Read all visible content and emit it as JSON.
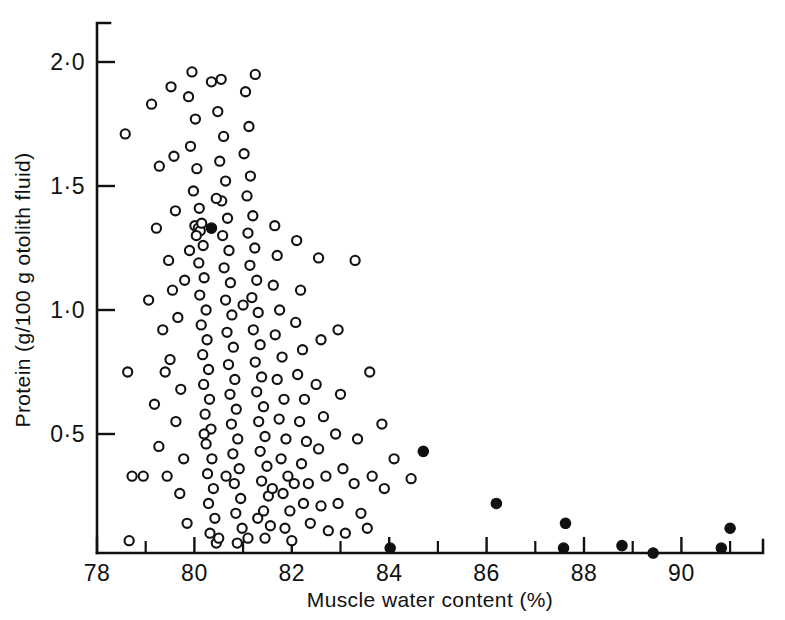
{
  "chart_data": {
    "type": "scatter",
    "title": "",
    "xlabel": "Muscle water content (%)",
    "ylabel": "Protein (g/100 g otolith fluid)",
    "xlim": [
      77.6,
      91.65
    ],
    "ylim": [
      0.0,
      2.18
    ],
    "grid": false,
    "legend": "none",
    "x_ticks_major": [
      78,
      80,
      82,
      84,
      86,
      88,
      90
    ],
    "x_ticklabels": [
      "78",
      "80",
      "82",
      "84",
      "86",
      "88",
      "90"
    ],
    "x_ticks_minor": [
      79,
      81,
      83,
      85,
      87,
      89,
      91
    ],
    "y_ticks_major": [
      0.5,
      1.0,
      1.5,
      2.0
    ],
    "y_ticklabels": [
      "0·5",
      "1·0",
      "1·5",
      "2·0"
    ],
    "marker_colors": {
      "open": "#ffffff",
      "edge": "#121212",
      "filled": "#101010"
    },
    "series": [
      {
        "name": "open circles",
        "marker": "open-circle",
        "points": [
          [
            78.58,
            1.71
          ],
          [
            78.63,
            0.75
          ],
          [
            78.72,
            0.33
          ],
          [
            78.66,
            0.07
          ],
          [
            79.12,
            1.83
          ],
          [
            79.28,
            1.58
          ],
          [
            79.22,
            1.33
          ],
          [
            79.06,
            1.04
          ],
          [
            79.35,
            0.92
          ],
          [
            79.18,
            0.62
          ],
          [
            79.27,
            0.45
          ],
          [
            79.44,
            0.33
          ],
          [
            79.52,
            1.9
          ],
          [
            79.58,
            1.62
          ],
          [
            79.61,
            1.4
          ],
          [
            79.47,
            1.2
          ],
          [
            79.55,
            1.08
          ],
          [
            79.66,
            0.97
          ],
          [
            79.5,
            0.8
          ],
          [
            79.72,
            0.68
          ],
          [
            79.62,
            0.55
          ],
          [
            79.78,
            0.4
          ],
          [
            79.7,
            0.26
          ],
          [
            79.85,
            0.14
          ],
          [
            79.95,
            1.96
          ],
          [
            79.88,
            1.86
          ],
          [
            80.02,
            1.77
          ],
          [
            79.92,
            1.66
          ],
          [
            80.05,
            1.57
          ],
          [
            79.98,
            1.48
          ],
          [
            80.1,
            1.41
          ],
          [
            80.01,
            1.34
          ],
          [
            80.08,
            1.33
          ],
          [
            80.12,
            1.32
          ],
          [
            80.15,
            1.35
          ],
          [
            80.04,
            1.3
          ],
          [
            80.18,
            1.26
          ],
          [
            80.09,
            1.19
          ],
          [
            80.2,
            1.13
          ],
          [
            80.11,
            1.06
          ],
          [
            80.24,
            1.0
          ],
          [
            80.14,
            0.94
          ],
          [
            80.26,
            0.88
          ],
          [
            80.17,
            0.82
          ],
          [
            80.29,
            0.76
          ],
          [
            80.19,
            0.7
          ],
          [
            80.31,
            0.64
          ],
          [
            80.22,
            0.58
          ],
          [
            80.34,
            0.52
          ],
          [
            80.24,
            0.46
          ],
          [
            80.36,
            0.4
          ],
          [
            80.27,
            0.34
          ],
          [
            80.39,
            0.28
          ],
          [
            80.29,
            0.22
          ],
          [
            80.42,
            0.16
          ],
          [
            80.32,
            0.1
          ],
          [
            80.45,
            0.06
          ],
          [
            80.55,
            1.93
          ],
          [
            80.48,
            1.8
          ],
          [
            80.6,
            1.7
          ],
          [
            80.52,
            1.6
          ],
          [
            80.64,
            1.52
          ],
          [
            80.56,
            1.44
          ],
          [
            80.68,
            1.37
          ],
          [
            80.58,
            1.3
          ],
          [
            80.71,
            1.24
          ],
          [
            80.61,
            1.17
          ],
          [
            80.74,
            1.11
          ],
          [
            80.64,
            1.04
          ],
          [
            80.77,
            0.98
          ],
          [
            80.67,
            0.91
          ],
          [
            80.8,
            0.85
          ],
          [
            80.7,
            0.78
          ],
          [
            80.83,
            0.72
          ],
          [
            80.73,
            0.66
          ],
          [
            80.86,
            0.6
          ],
          [
            80.76,
            0.54
          ],
          [
            80.89,
            0.48
          ],
          [
            80.79,
            0.42
          ],
          [
            80.92,
            0.36
          ],
          [
            80.82,
            0.3
          ],
          [
            80.95,
            0.24
          ],
          [
            80.85,
            0.18
          ],
          [
            80.98,
            0.12
          ],
          [
            80.88,
            0.06
          ],
          [
            81.05,
            1.88
          ],
          [
            81.12,
            1.74
          ],
          [
            81.02,
            1.63
          ],
          [
            81.15,
            1.54
          ],
          [
            81.08,
            1.46
          ],
          [
            81.2,
            1.38
          ],
          [
            81.1,
            1.31
          ],
          [
            81.24,
            1.25
          ],
          [
            81.14,
            1.18
          ],
          [
            81.28,
            1.12
          ],
          [
            81.18,
            1.05
          ],
          [
            81.31,
            0.99
          ],
          [
            81.21,
            0.92
          ],
          [
            81.35,
            0.86
          ],
          [
            81.25,
            0.79
          ],
          [
            81.38,
            0.73
          ],
          [
            81.28,
            0.67
          ],
          [
            81.42,
            0.61
          ],
          [
            81.32,
            0.55
          ],
          [
            81.45,
            0.49
          ],
          [
            81.35,
            0.43
          ],
          [
            81.49,
            0.37
          ],
          [
            81.38,
            0.31
          ],
          [
            81.52,
            0.25
          ],
          [
            81.42,
            0.19
          ],
          [
            81.56,
            0.13
          ],
          [
            81.45,
            0.08
          ],
          [
            81.65,
            1.34
          ],
          [
            81.7,
            1.22
          ],
          [
            81.62,
            1.1
          ],
          [
            81.75,
            1.0
          ],
          [
            81.66,
            0.9
          ],
          [
            81.8,
            0.81
          ],
          [
            81.7,
            0.72
          ],
          [
            81.84,
            0.64
          ],
          [
            81.74,
            0.56
          ],
          [
            81.88,
            0.48
          ],
          [
            81.78,
            0.4
          ],
          [
            81.92,
            0.33
          ],
          [
            81.82,
            0.26
          ],
          [
            81.96,
            0.19
          ],
          [
            81.86,
            0.12
          ],
          [
            82.0,
            0.07
          ],
          [
            82.1,
            1.28
          ],
          [
            82.18,
            1.08
          ],
          [
            82.08,
            0.95
          ],
          [
            82.22,
            0.84
          ],
          [
            82.12,
            0.74
          ],
          [
            82.26,
            0.64
          ],
          [
            82.16,
            0.55
          ],
          [
            82.3,
            0.47
          ],
          [
            82.2,
            0.38
          ],
          [
            82.34,
            0.3
          ],
          [
            82.24,
            0.22
          ],
          [
            82.38,
            0.14
          ],
          [
            82.55,
            1.21
          ],
          [
            82.6,
            0.88
          ],
          [
            82.5,
            0.7
          ],
          [
            82.65,
            0.57
          ],
          [
            82.55,
            0.44
          ],
          [
            82.7,
            0.33
          ],
          [
            82.6,
            0.21
          ],
          [
            82.75,
            0.11
          ],
          [
            82.95,
            0.92
          ],
          [
            83.0,
            0.66
          ],
          [
            82.9,
            0.5
          ],
          [
            83.05,
            0.36
          ],
          [
            82.95,
            0.22
          ],
          [
            83.1,
            0.1
          ],
          [
            83.3,
            1.2
          ],
          [
            83.35,
            0.48
          ],
          [
            83.28,
            0.3
          ],
          [
            83.42,
            0.18
          ],
          [
            83.6,
            0.75
          ],
          [
            83.65,
            0.33
          ],
          [
            83.55,
            0.12
          ],
          [
            83.85,
            0.54
          ],
          [
            83.9,
            0.28
          ],
          [
            84.1,
            0.4
          ],
          [
            84.45,
            0.32
          ],
          [
            81.25,
            1.95
          ],
          [
            80.35,
            1.92
          ],
          [
            79.9,
            1.24
          ],
          [
            80.45,
            1.45
          ],
          [
            81.0,
            1.02
          ],
          [
            80.65,
            0.33
          ],
          [
            81.3,
            0.16
          ],
          [
            80.2,
            0.5
          ],
          [
            79.8,
            1.12
          ],
          [
            81.6,
            0.28
          ],
          [
            82.05,
            0.3
          ],
          [
            80.5,
            0.08
          ],
          [
            81.1,
            0.08
          ],
          [
            79.4,
            0.75
          ],
          [
            78.95,
            0.33
          ]
        ]
      },
      {
        "name": "filled circles",
        "marker": "filled-circle",
        "points": [
          [
            80.35,
            1.33
          ],
          [
            84.7,
            0.43
          ],
          [
            84.02,
            0.04
          ],
          [
            86.2,
            0.22
          ],
          [
            87.62,
            0.14
          ],
          [
            87.58,
            0.04
          ],
          [
            88.78,
            0.05
          ],
          [
            89.42,
            0.02
          ],
          [
            90.82,
            0.04
          ],
          [
            91.0,
            0.12
          ]
        ]
      }
    ]
  }
}
